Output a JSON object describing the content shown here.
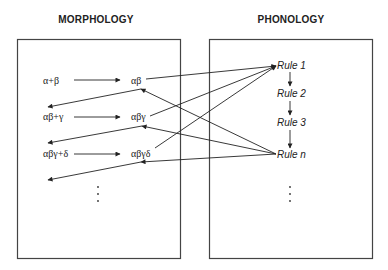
{
  "morphology": {
    "title": "MORPHOLOGY",
    "inputs": [
      "α+β",
      "αβ+γ",
      "αβγ+δ"
    ],
    "outputs": [
      "αβ",
      "αβγ",
      "αβγδ"
    ],
    "continuation": "⋮"
  },
  "phonology": {
    "title": "PHONOLOGY",
    "rules": [
      "Rule 1",
      "Rule 2",
      "Rule 3",
      "Rule n"
    ],
    "continuation": "⋮"
  },
  "colors": {
    "stroke": "#222222",
    "box": "#444444",
    "background": "#ffffff"
  }
}
